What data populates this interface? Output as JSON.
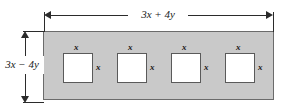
{
  "figure": {
    "type": "geometry-diagram",
    "background_color": "#ffffff",
    "plate": {
      "fill_color": "#c9c9c9",
      "border_color": "#6b6b6b",
      "width_label": "3x + 4y",
      "height_label": "3x − 4y"
    },
    "holes": [
      {
        "top_label": "x",
        "right_label": "x",
        "fill_color": "#ffffff"
      },
      {
        "top_label": "x",
        "right_label": "x",
        "fill_color": "#ffffff"
      },
      {
        "top_label": "x",
        "right_label": "x",
        "fill_color": "#ffffff"
      },
      {
        "top_label": "x",
        "right_label": "x",
        "fill_color": "#ffffff"
      }
    ],
    "dimensions": {
      "horizontal": {
        "label": "3x + 4y",
        "position": "top",
        "arrows": "both"
      },
      "vertical": {
        "label": "3x − 4y",
        "position": "left",
        "arrows": "both"
      }
    }
  }
}
